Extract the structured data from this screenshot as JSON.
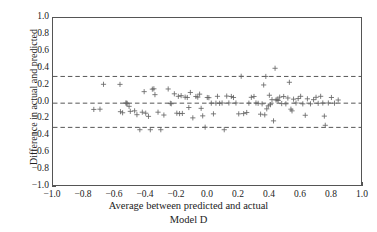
{
  "chart_data": {
    "type": "scatter",
    "title": "",
    "subtitle": "Model D",
    "xlabel": "Average between predicted and actual",
    "ylabel": "Difference in actual and predicted",
    "xlim": [
      -1.0,
      1.0
    ],
    "ylim": [
      -1.0,
      1.0
    ],
    "xticks": [
      -1.0,
      -0.8,
      -0.6,
      -0.4,
      -0.2,
      0.0,
      0.2,
      0.4,
      0.6,
      0.8,
      1.0
    ],
    "yticks": [
      1.0,
      0.8,
      0.6,
      0.4,
      0.2,
      0.0,
      -0.2,
      -0.4,
      -0.6,
      -0.8,
      -1.0
    ],
    "xticklabels": [
      "-1.0",
      "-0.8",
      "-0.6",
      "-0.4",
      "-0.2",
      "0.0",
      "0.2",
      "0.4",
      "0.6",
      "0.8",
      "1.0"
    ],
    "yticklabels": [
      "1.0",
      "0.8",
      "0.6",
      "0.4",
      "0.2",
      "0.0",
      "-0.2",
      "-0.4",
      "-0.6",
      "-0.8",
      "-1.0"
    ],
    "grid": false,
    "legend": null,
    "marker": "plus",
    "marker_color": "#666666",
    "reference_lines": [
      {
        "name": "upper-limit-of-agreement",
        "y": 0.3,
        "style": "dashed",
        "color": "#555555"
      },
      {
        "name": "mean-bias",
        "y": -0.02,
        "style": "dashed",
        "color": "#555555"
      },
      {
        "name": "lower-limit-of-agreement",
        "y": -0.31,
        "style": "dashed",
        "color": "#555555"
      }
    ],
    "series": [
      {
        "name": "differences",
        "points": [
          [
            -0.735,
            -0.095
          ],
          [
            -0.695,
            -0.092
          ],
          [
            -0.672,
            0.206
          ],
          [
            -0.565,
            0.205
          ],
          [
            -0.562,
            -0.122
          ],
          [
            -0.548,
            -0.135
          ],
          [
            -0.527,
            -0.018
          ],
          [
            -0.521,
            -0.02
          ],
          [
            -0.519,
            -0.024
          ],
          [
            -0.506,
            -0.058
          ],
          [
            -0.498,
            -0.118
          ],
          [
            -0.47,
            -0.112
          ],
          [
            -0.455,
            -0.158
          ],
          [
            -0.436,
            -0.338
          ],
          [
            -0.42,
            -0.128
          ],
          [
            -0.408,
            0.118
          ],
          [
            -0.398,
            -0.14
          ],
          [
            -0.38,
            -0.178
          ],
          [
            -0.368,
            -0.338
          ],
          [
            -0.355,
            0.148
          ],
          [
            -0.345,
            0.152
          ],
          [
            -0.338,
            0.082
          ],
          [
            -0.318,
            -0.128
          ],
          [
            -0.3,
            -0.338
          ],
          [
            -0.28,
            -0.162
          ],
          [
            -0.252,
            0.15
          ],
          [
            -0.238,
            -0.022
          ],
          [
            -0.232,
            -0.027
          ],
          [
            -0.212,
            0.092
          ],
          [
            -0.196,
            -0.14
          ],
          [
            -0.186,
            0.062
          ],
          [
            -0.178,
            -0.145
          ],
          [
            -0.168,
            0.07
          ],
          [
            -0.16,
            -0.143
          ],
          [
            -0.142,
            0.052
          ],
          [
            -0.128,
            0.048
          ],
          [
            -0.118,
            -0.072
          ],
          [
            -0.108,
            0.108
          ],
          [
            -0.092,
            -0.196
          ],
          [
            -0.072,
            0.06
          ],
          [
            -0.06,
            0.052
          ],
          [
            -0.048,
            0.088
          ],
          [
            -0.038,
            -0.082
          ],
          [
            -0.028,
            -0.172
          ],
          [
            -0.012,
            -0.308
          ],
          [
            0.002,
            0.048
          ],
          [
            0.012,
            0.046
          ],
          [
            0.028,
            -0.02
          ],
          [
            0.042,
            -0.148
          ],
          [
            0.058,
            -0.02
          ],
          [
            0.068,
            0.062
          ],
          [
            0.082,
            -0.022
          ],
          [
            0.098,
            -0.018
          ],
          [
            0.112,
            -0.338
          ],
          [
            0.128,
            0.065
          ],
          [
            0.142,
            -0.018
          ],
          [
            0.158,
            0.06
          ],
          [
            0.172,
            0.048
          ],
          [
            0.188,
            -0.018
          ],
          [
            0.206,
            -0.148
          ],
          [
            0.222,
            0.302
          ],
          [
            0.238,
            -0.145
          ],
          [
            0.258,
            -0.132
          ],
          [
            0.272,
            -0.02
          ],
          [
            0.288,
            0.05
          ],
          [
            0.305,
            0.06
          ],
          [
            0.318,
            -0.018
          ],
          [
            0.332,
            -0.022
          ],
          [
            0.348,
            -0.152
          ],
          [
            0.358,
            -0.028
          ],
          [
            0.368,
            0.198
          ],
          [
            0.375,
            -0.16
          ],
          [
            0.382,
            0.3
          ],
          [
            0.388,
            -0.088
          ],
          [
            0.398,
            -0.052
          ],
          [
            0.405,
            0.075
          ],
          [
            0.412,
            -0.038
          ],
          [
            0.422,
            0.022
          ],
          [
            0.432,
            -0.232
          ],
          [
            0.442,
            0.398
          ],
          [
            0.448,
            0.018
          ],
          [
            0.455,
            0.026
          ],
          [
            0.462,
            0.012
          ],
          [
            0.472,
            0.052
          ],
          [
            0.485,
            -0.025
          ],
          [
            0.498,
            0.06
          ],
          [
            0.512,
            -0.028
          ],
          [
            0.525,
            0.042
          ],
          [
            0.535,
            0.23
          ],
          [
            0.545,
            -0.092
          ],
          [
            0.552,
            -0.112
          ],
          [
            0.562,
            0.028
          ],
          [
            0.578,
            -0.018
          ],
          [
            0.592,
            0.035
          ],
          [
            0.608,
            0.062
          ],
          [
            0.622,
            -0.028
          ],
          [
            0.638,
            -0.165
          ],
          [
            0.652,
            0.032
          ],
          [
            0.672,
            -0.028
          ],
          [
            0.692,
            0.022
          ],
          [
            0.708,
            0.05
          ],
          [
            0.722,
            -0.022
          ],
          [
            0.738,
            0.062
          ],
          [
            0.752,
            -0.018
          ],
          [
            0.762,
            -0.175
          ],
          [
            0.768,
            -0.285
          ],
          [
            0.788,
            -0.018
          ],
          [
            0.808,
            0.048
          ],
          [
            0.828,
            -0.02
          ],
          [
            0.852,
            0.018
          ]
        ]
      }
    ]
  }
}
